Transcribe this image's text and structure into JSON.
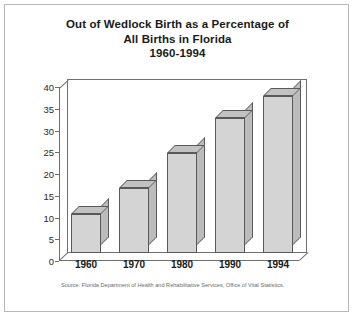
{
  "title_lines": [
    "Out of Wedlock Birth as a Percentage of",
    "All Births in Florida",
    "1960-1994"
  ],
  "source": "Source: Florida Department of Health and Rehabilitative Services, Office of Vital Statistics.",
  "colors": {
    "bar_front": "#d4d4d4",
    "bar_top": "#c2c2c2",
    "bar_side": "#bcbcbc",
    "outline": "#595959",
    "axis": "#6e6e6e",
    "frame": "#b8b8b8",
    "text": "#1a1a1a"
  },
  "chart_data": {
    "type": "bar",
    "title": "Out of Wedlock Birth as a Percentage of All Births in Florida 1960-1994",
    "categories": [
      "1960",
      "1970",
      "1980",
      "1990",
      "1994"
    ],
    "values": [
      9,
      15,
      23,
      31,
      36
    ],
    "xlabel": "",
    "ylabel": "",
    "ylim": [
      0,
      40
    ],
    "yticks": [
      0,
      5,
      10,
      15,
      20,
      25,
      30,
      35,
      40
    ],
    "grid": false,
    "legend": false,
    "style": "3d-bar"
  }
}
